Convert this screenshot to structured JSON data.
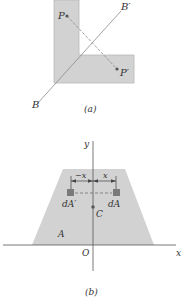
{
  "figure_a": {
    "caption": "(a)",
    "points": {
      "P": "P",
      "P_prime": "P′"
    },
    "axis_labels": {
      "B": "B",
      "B_prime": "B′"
    },
    "colors": {
      "shape_fill": "#d2d2d2",
      "shape_stroke": "#b8b8b8",
      "line": "#8a8a8a",
      "point": "#555555"
    }
  },
  "figure_b": {
    "caption": "(b)",
    "axes": {
      "x": "x",
      "y": "y",
      "origin": "O"
    },
    "labels": {
      "area": "A",
      "centroid": "C",
      "dA": "dA",
      "dA_prime": "dA′",
      "neg_x": "−x",
      "pos_x": "x"
    },
    "colors": {
      "shape_fill": "#d2d2d2",
      "element_fill": "#7a7a7a",
      "axis": "#555555"
    }
  }
}
